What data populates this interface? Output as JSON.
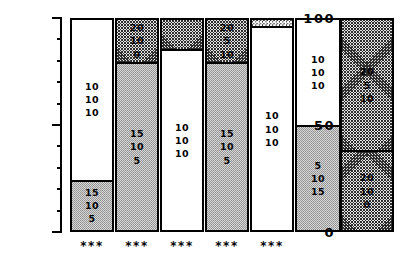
{
  "axis": {
    "ylabel": "intake ( % )",
    "ticklabels": [
      "100",
      "50",
      "0"
    ]
  },
  "chart_data": {
    "type": "bar",
    "title": "",
    "xlabel": "",
    "ylabel": "intake ( % )",
    "ylim": [
      0,
      100
    ],
    "major_ticks": [
      0,
      50,
      100
    ],
    "minor_tick_interval": 10,
    "grid": false,
    "legend": "none",
    "orientation": "vertical",
    "stacked": true,
    "categories": [
      "1",
      "2",
      "3",
      "4",
      "5",
      "6",
      "7"
    ],
    "bars": [
      {
        "index": 1,
        "significance": "***",
        "segments": [
          {
            "pattern": "white",
            "from": 24,
            "to": 100,
            "height": 76,
            "labels": [
              "10",
              "10",
              "10"
            ]
          },
          {
            "pattern": "stipple",
            "from": 0,
            "to": 24,
            "height": 24,
            "labels": [
              "15",
              "10",
              "5"
            ]
          }
        ]
      },
      {
        "index": 2,
        "significance": "***",
        "segments": [
          {
            "pattern": "hatch",
            "from": 80,
            "to": 100,
            "height": 20,
            "labels": [
              "20",
              "10",
              "0"
            ]
          },
          {
            "pattern": "stipple",
            "from": 0,
            "to": 80,
            "height": 80,
            "labels": [
              "15",
              "10",
              "5"
            ]
          }
        ]
      },
      {
        "index": 3,
        "significance": "***",
        "segments": [
          {
            "pattern": "hatch",
            "from": 86,
            "to": 100,
            "height": 14,
            "labels": []
          },
          {
            "pattern": "white",
            "from": 0,
            "to": 86,
            "height": 86,
            "labels": [
              "10",
              "10",
              "10"
            ]
          }
        ]
      },
      {
        "index": 4,
        "significance": "***",
        "segments": [
          {
            "pattern": "hatch",
            "from": 80,
            "to": 100,
            "height": 20,
            "labels": [
              "20",
              "5",
              "10"
            ]
          },
          {
            "pattern": "stipple",
            "from": 0,
            "to": 80,
            "height": 80,
            "labels": [
              "15",
              "10",
              "5"
            ]
          }
        ]
      },
      {
        "index": 5,
        "significance": "***",
        "segments": [
          {
            "pattern": "bubble",
            "from": 97,
            "to": 100,
            "height": 3,
            "labels": []
          },
          {
            "pattern": "white",
            "from": 0,
            "to": 97,
            "height": 97,
            "labels": [
              "10",
              "10",
              "10"
            ]
          }
        ]
      },
      {
        "index": 6,
        "significance": "",
        "segments": [
          {
            "pattern": "white",
            "from": 50,
            "to": 100,
            "height": 50,
            "labels": [
              "10",
              "10",
              "10"
            ]
          },
          {
            "pattern": "stipple",
            "from": 0,
            "to": 50,
            "height": 50,
            "labels": [
              "5",
              "10",
              "15"
            ]
          }
        ]
      },
      {
        "index": 7,
        "significance": "",
        "segments": [
          {
            "pattern": "hatch",
            "from": 38,
            "to": 100,
            "height": 62,
            "labels": [
              "20",
              "5",
              "10"
            ]
          },
          {
            "pattern": "hatch",
            "from": 0,
            "to": 38,
            "height": 38,
            "labels": [
              "20",
              "10",
              "0"
            ]
          }
        ]
      }
    ]
  }
}
